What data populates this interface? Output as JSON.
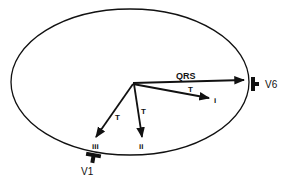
{
  "diagram": {
    "type": "vector-loop",
    "loop_shape": "ellipse",
    "vectors": [
      {
        "id": "qrs",
        "label": "QRS"
      },
      {
        "id": "t-i",
        "label": "T",
        "end_label": "i"
      },
      {
        "id": "t-ii",
        "label": "T",
        "end_label": "ii"
      },
      {
        "id": "t-iii",
        "label": "T",
        "end_label": "iii"
      }
    ],
    "electrodes": [
      {
        "id": "v6",
        "label": "V6"
      },
      {
        "id": "v1",
        "label": "V1"
      }
    ],
    "colors": {
      "stroke": "#111111",
      "background": "#ffffff"
    }
  }
}
